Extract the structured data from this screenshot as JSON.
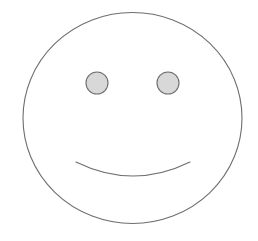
{
  "canvas": {
    "width": 258,
    "height": 241,
    "background_color": "#ffffff",
    "title": "smiley-face-drawing"
  },
  "colors": {
    "stroke": "#6e6e6e",
    "face_fill": "none",
    "eye_fill": "#d8d8d8",
    "mouth_fill": "none",
    "background": "#ffffff"
  },
  "figure": {
    "name": "smiley-face",
    "label": "Smiley Face",
    "shapes": [
      {
        "name": "face-outline",
        "type": "ellipse",
        "cx": 132.5,
        "cy": 118,
        "rx": 109.5,
        "ry": 105.5,
        "fill": "none",
        "stroke": "#6e6e6e",
        "stroke_width": 1.1
      },
      {
        "name": "left-eye",
        "type": "circle",
        "cx": 97,
        "cy": 83,
        "r": 11,
        "fill": "#d8d8d8",
        "stroke": "#6e6e6e",
        "stroke_width": 1.1
      },
      {
        "name": "right-eye",
        "type": "circle",
        "cx": 168,
        "cy": 83,
        "r": 11,
        "fill": "#d8d8d8",
        "stroke": "#6e6e6e",
        "stroke_width": 1.1
      },
      {
        "name": "mouth-smile",
        "type": "arc",
        "path": "M 76 162 Q 133 190 190 162",
        "start": [
          76,
          162
        ],
        "end": [
          190,
          162
        ],
        "lowest_point": [
          133,
          179
        ],
        "fill": "none",
        "stroke": "#6e6e6e",
        "stroke_width": 1.1
      }
    ]
  }
}
